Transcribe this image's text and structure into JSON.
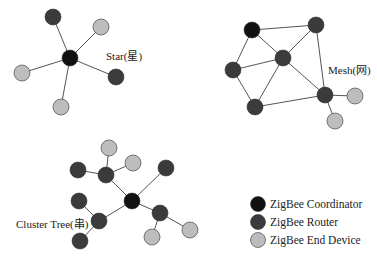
{
  "colors": {
    "coordinator": "#111111",
    "router": "#3b3b3b",
    "end": "#bdbdbd"
  },
  "topologies": [
    {
      "name": "star",
      "label": "Star(星)",
      "nodes": [
        {
          "id": "c",
          "type": "coordinator"
        },
        {
          "id": "r1",
          "type": "router"
        },
        {
          "id": "e1",
          "type": "end"
        },
        {
          "id": "e2",
          "type": "end"
        },
        {
          "id": "r2",
          "type": "router"
        },
        {
          "id": "e3",
          "type": "end"
        }
      ],
      "edges": [
        [
          "c",
          "r1"
        ],
        [
          "c",
          "e1"
        ],
        [
          "c",
          "e2"
        ],
        [
          "c",
          "r2"
        ],
        [
          "c",
          "e3"
        ]
      ]
    },
    {
      "name": "mesh",
      "label": "Mesh(网)",
      "nodes": [
        {
          "id": "c",
          "type": "coordinator"
        },
        {
          "id": "r1",
          "type": "router"
        },
        {
          "id": "r2",
          "type": "router"
        },
        {
          "id": "r3",
          "type": "router"
        },
        {
          "id": "r4",
          "type": "router"
        },
        {
          "id": "r5",
          "type": "router"
        },
        {
          "id": "e1",
          "type": "end"
        },
        {
          "id": "e2",
          "type": "end"
        }
      ],
      "edges": [
        [
          "c",
          "r1"
        ],
        [
          "c",
          "r2"
        ],
        [
          "c",
          "r3"
        ],
        [
          "r1",
          "r2"
        ],
        [
          "r1",
          "r5"
        ],
        [
          "r2",
          "r3"
        ],
        [
          "r2",
          "r4"
        ],
        [
          "r2",
          "r5"
        ],
        [
          "r3",
          "r4"
        ],
        [
          "r4",
          "r5"
        ],
        [
          "r5",
          "e1"
        ],
        [
          "r5",
          "e2"
        ]
      ]
    },
    {
      "name": "cluster-tree",
      "label": "Cluster Tree(串)",
      "nodes": [
        {
          "id": "c",
          "type": "coordinator"
        },
        {
          "id": "ru",
          "type": "router"
        },
        {
          "id": "eu1",
          "type": "end"
        },
        {
          "id": "eu2",
          "type": "end"
        },
        {
          "id": "rul",
          "type": "router"
        },
        {
          "id": "rfr",
          "type": "router"
        },
        {
          "id": "rm",
          "type": "router"
        },
        {
          "id": "rml",
          "type": "router"
        },
        {
          "id": "rmb",
          "type": "router"
        },
        {
          "id": "rr",
          "type": "router"
        },
        {
          "id": "er1",
          "type": "end"
        },
        {
          "id": "er2",
          "type": "end"
        }
      ],
      "edges": [
        [
          "c",
          "ru"
        ],
        [
          "ru",
          "eu1"
        ],
        [
          "ru",
          "eu2"
        ],
        [
          "ru",
          "rul"
        ],
        [
          "c",
          "rfr"
        ],
        [
          "c",
          "rm"
        ],
        [
          "rm",
          "rml"
        ],
        [
          "rm",
          "rmb"
        ],
        [
          "c",
          "rr"
        ],
        [
          "rr",
          "er1"
        ],
        [
          "rr",
          "er2"
        ]
      ]
    }
  ],
  "legend": [
    {
      "type": "coordinator",
      "label": "ZigBee Coordinator"
    },
    {
      "type": "router",
      "label": "ZigBee Router"
    },
    {
      "type": "end",
      "label": "ZigBee End Device"
    }
  ]
}
